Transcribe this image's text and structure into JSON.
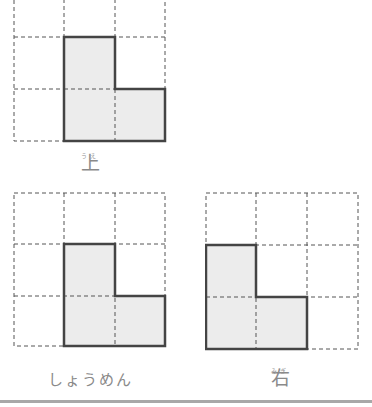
{
  "views": [
    {
      "id": "top",
      "label": "上",
      "furigana": "うえ",
      "grid": {
        "cols": 3,
        "rows": 3
      },
      "filled_cells": [
        [
          1,
          1
        ],
        [
          1,
          2
        ],
        [
          2,
          2
        ]
      ]
    },
    {
      "id": "front",
      "label": "しょうめん",
      "furigana": "",
      "grid": {
        "cols": 3,
        "rows": 3
      },
      "filled_cells": [
        [
          1,
          1
        ],
        [
          1,
          2
        ],
        [
          2,
          2
        ]
      ]
    },
    {
      "id": "right",
      "label": "右",
      "furigana": "みぎ",
      "grid": {
        "cols": 3,
        "rows": 3
      },
      "filled_cells": [
        [
          0,
          1
        ],
        [
          0,
          2
        ],
        [
          1,
          2
        ]
      ]
    }
  ],
  "colors": {
    "fill": "#ececec",
    "outline": "#444444",
    "dashed": "#555555",
    "label": "#8a8a8a",
    "rule": "#a8a8a8"
  }
}
